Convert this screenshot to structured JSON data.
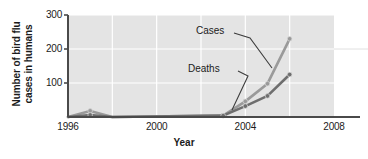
{
  "chart_data": {
    "type": "line",
    "title": "",
    "xlabel": "Year",
    "ylabel_line1": "Number of bird flu",
    "ylabel_line2": "cases in humans",
    "xlim": [
      1996,
      2008
    ],
    "ylim": [
      0,
      300
    ],
    "xticks": [
      "1996",
      "2000",
      "2004",
      "2008"
    ],
    "xtick_values": [
      1996,
      2000,
      2004,
      2008
    ],
    "yticks": [
      "100",
      "200",
      "300"
    ],
    "ytick_values": [
      100,
      200,
      300
    ],
    "grid": "white gridlines on gray panel, vertical every 2 years, horizontal at 100/200/300",
    "legend_position": "inline annotations with leader lines",
    "plot_bg_color": "#e4e4e4",
    "gridline_color": "#ffffff",
    "axis_color": "#4a4a4a",
    "series": [
      {
        "name": "Cases",
        "color": "#9a9a9a",
        "marker": "circle",
        "x": [
          1996,
          1997,
          1998,
          2003,
          2004,
          2005,
          2006
        ],
        "values": [
          0,
          18,
          0,
          4,
          46,
          98,
          230
        ]
      },
      {
        "name": "Deaths",
        "color": "#6e6e6e",
        "marker": "circle",
        "x": [
          1996,
          1997,
          1998,
          2003,
          2004,
          2005,
          2006
        ],
        "values": [
          0,
          6,
          0,
          4,
          32,
          62,
          125
        ]
      }
    ],
    "annotations": [
      {
        "text": "Cases",
        "x": 2002.0,
        "y": 268
      },
      {
        "text": "Deaths",
        "x": 2001.4,
        "y": 172
      }
    ]
  }
}
